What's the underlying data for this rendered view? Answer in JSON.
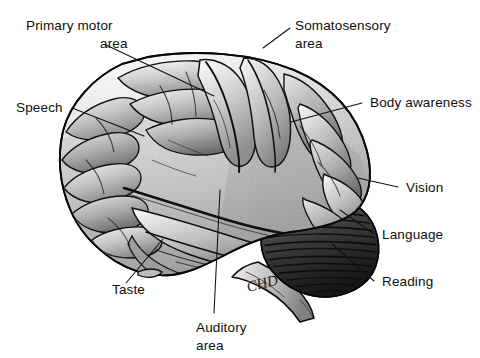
{
  "figure": {
    "background_color": "#ffffff",
    "ink_color": "#0d0d0d",
    "style": "grayscale pen-and-ink anatomical illustration",
    "signature": "CHD"
  },
  "labels": [
    {
      "id": "primary-motor-area",
      "line1": "Primary motor",
      "line2": "area",
      "align": "two-line-right"
    },
    {
      "id": "somatosensory-area",
      "line1": "Somatosensory",
      "line2": "area",
      "align": "two-line-left"
    },
    {
      "id": "speech",
      "line1": "Speech",
      "line2": "",
      "align": "single"
    },
    {
      "id": "body-awareness",
      "line1": "Body awareness",
      "line2": "",
      "align": "single"
    },
    {
      "id": "vision",
      "line1": "Vision",
      "line2": "",
      "align": "single"
    },
    {
      "id": "language",
      "line1": "Language",
      "line2": "",
      "align": "single"
    },
    {
      "id": "reading",
      "line1": "Reading",
      "line2": "",
      "align": "single"
    },
    {
      "id": "taste",
      "line1": "Taste",
      "line2": "",
      "align": "single"
    },
    {
      "id": "auditory-area",
      "line1": "Auditory",
      "line2": "area",
      "align": "two-line-left"
    }
  ],
  "anatomy": {
    "cerebrum": "cerebral cortex with gyri and sulci",
    "cerebellum": "cerebellum with horizontal folia striations",
    "brainstem": "brainstem / medulla"
  }
}
